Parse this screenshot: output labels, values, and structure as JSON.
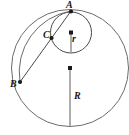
{
  "figure": {
    "title": "",
    "background_color": "#ffffff",
    "stroke_color": "#5a5a5a",
    "label_color": "#1a1a1a",
    "width": 129,
    "height": 135
  },
  "labels": {
    "point_a": "A",
    "point_b": "B",
    "point_c": "C",
    "small_radius": "r",
    "large_radius": "R"
  },
  "geometry": {
    "large_circle": {
      "cx": 70,
      "cy": 68,
      "r": 58.5
    },
    "small_circle": {
      "cx": 71,
      "cy": 32.5,
      "r": 20.5
    },
    "arc_b_to_a": {
      "from": [
        20,
        82
      ],
      "to": [
        71,
        11
      ],
      "sweep_radius": 62
    },
    "chord_b_to_a": {
      "from": [
        20,
        82
      ],
      "to": [
        71,
        11
      ]
    },
    "radius_r_segment": {
      "from": [
        71,
        32.5
      ],
      "to": [
        71,
        52.5
      ]
    },
    "radius_R_segment": {
      "from": [
        70,
        68
      ],
      "to": [
        70,
        126.5
      ]
    },
    "points": [
      {
        "name": "A",
        "x": 71,
        "y": 11
      },
      {
        "name": "B",
        "x": 20,
        "y": 82
      },
      {
        "name": "C",
        "x": 51.5,
        "y": 38
      },
      {
        "name": "small-circle-center",
        "x": 71,
        "y": 32.5
      },
      {
        "name": "large-circle-center",
        "x": 70,
        "y": 68
      }
    ]
  }
}
